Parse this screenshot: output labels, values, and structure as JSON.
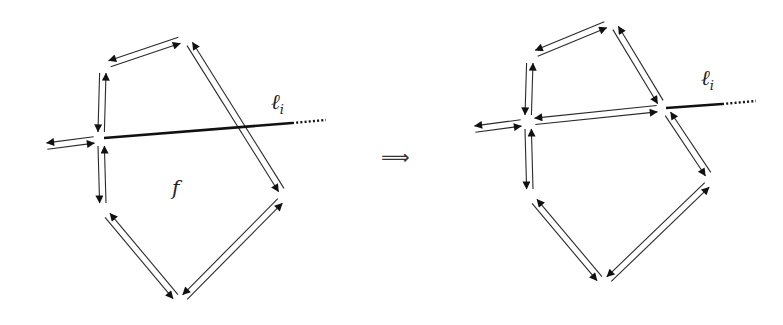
{
  "figure": {
    "transition_symbol": "⟹",
    "colors": {
      "ink": "#2a2a2a",
      "line": "#111111",
      "background": "#ffffff"
    }
  },
  "left_diagram": {
    "face_label": "f",
    "line_label": "ℓ",
    "line_subscript": "i",
    "vertices": {
      "A": [
        103,
        66
      ],
      "B": [
        186,
        38
      ],
      "V": [
        101,
        139
      ],
      "R": [
        285,
        196
      ],
      "BOT": [
        180,
        302
      ],
      "LL": [
        103,
        210
      ],
      "EXT": [
        40,
        147
      ]
    },
    "half_edge_pairs": [
      [
        "V",
        "A"
      ],
      [
        "A",
        "B"
      ],
      [
        "B",
        "R"
      ],
      [
        "R",
        "BOT"
      ],
      [
        "BOT",
        "LL"
      ],
      [
        "LL",
        "V"
      ],
      [
        "V",
        "EXT"
      ]
    ],
    "line": {
      "start": [
        104,
        138
      ],
      "solid_end": [
        292,
        123
      ],
      "dotted_end": [
        326,
        120
      ]
    }
  },
  "right_diagram": {
    "line_label": "ℓ",
    "line_subscript": "i",
    "vertices": {
      "A": [
        530,
        56
      ],
      "B": [
        612,
        22
      ],
      "V": [
        528,
        122
      ],
      "W": [
        664,
        108
      ],
      "R": [
        712,
        180
      ],
      "BOT": [
        604,
        284
      ],
      "LL": [
        530,
        196
      ],
      "EXT": [
        468,
        130
      ]
    },
    "half_edge_pairs": [
      [
        "V",
        "A"
      ],
      [
        "A",
        "B"
      ],
      [
        "B",
        "W"
      ],
      [
        "W",
        "R"
      ],
      [
        "R",
        "BOT"
      ],
      [
        "BOT",
        "LL"
      ],
      [
        "LL",
        "V"
      ],
      [
        "V",
        "EXT"
      ],
      [
        "V",
        "W"
      ]
    ],
    "line": {
      "start": [
        666,
        108
      ],
      "solid_end": [
        722,
        104
      ],
      "dotted_end": [
        756,
        101
      ]
    }
  }
}
